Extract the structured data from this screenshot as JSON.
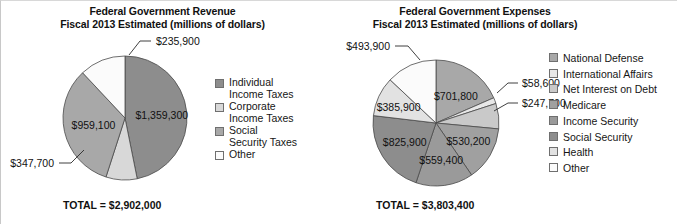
{
  "figure": {
    "width": 677,
    "height": 224,
    "background": "#ffffff"
  },
  "palette": {
    "dark_gray": "#8d8d8d",
    "mid_gray": "#a8a8a8",
    "light_gray": "#c9c9c9",
    "lighter_gray": "#d8d8d8",
    "very_light_gray": "#e8e8e8",
    "near_white": "#f2f2f2",
    "white": "#fbfbfb",
    "outline": "#4a4a4a"
  },
  "charts": [
    {
      "id": "revenue",
      "title_line1": "Federal Government Revenue",
      "title_line2": "Fiscal 2013 Estimated (millions of dollars)",
      "total_label": "TOTAL = $2,902,000",
      "legend": [
        {
          "label": "Individual\nIncome Taxes",
          "color": "#8d8d8d"
        },
        {
          "label": "Corporate\nIncome Taxes",
          "color": "#d8d8d8"
        },
        {
          "label": "Social\nSecurity Taxes",
          "color": "#a8a8a8"
        },
        {
          "label": "Other",
          "color": "#fbfbfb"
        }
      ]
    },
    {
      "id": "expenses",
      "title_line1": "Federal Government Expenses",
      "title_line2": "Fiscal 2013 Estimated (millions of dollars)",
      "total_label": "TOTAL = $3,803,400",
      "legend": [
        {
          "label": "National Defense",
          "color": "#a8a8a8"
        },
        {
          "label": "International Affairs",
          "color": "#e8e8e8"
        },
        {
          "label": "Net Interest on Debt",
          "color": "#c9c9c9"
        },
        {
          "label": "Medicare",
          "color": "#a0a0a0"
        },
        {
          "label": "Income Security",
          "color": "#9a9a9a"
        },
        {
          "label": "Social Security",
          "color": "#8d8d8d"
        },
        {
          "label": "Health",
          "color": "#e2e2e2"
        },
        {
          "label": "Other",
          "color": "#fbfbfb"
        }
      ]
    }
  ],
  "chart_data": [
    {
      "type": "pie",
      "title": "Federal Government Revenue — Fiscal 2013 Estimated (millions of dollars)",
      "total": 2902000,
      "total_label": "TOTAL = $2,902,000",
      "units": "millions of dollars",
      "start_angle_deg": 0,
      "direction": "clockwise",
      "legend_position": "right",
      "labels": [
        "Individual Income Taxes",
        "Corporate Income Taxes",
        "Social Security Taxes",
        "Other"
      ],
      "values": [
        1359300,
        235900,
        959100,
        347700
      ],
      "value_labels": [
        "$1,359,300",
        "$235,900",
        "$959,100",
        "$347,700"
      ],
      "colors": [
        "#8d8d8d",
        "#d8d8d8",
        "#a8a8a8",
        "#fbfbfb"
      ],
      "slices": [
        {
          "label": "Individual Income Taxes",
          "value": 1359300,
          "value_label": "$1,359,300",
          "color": "#8d8d8d",
          "label_placement": "inside"
        },
        {
          "label": "Corporate Income Taxes",
          "value": 235900,
          "value_label": "$235,900",
          "color": "#d8d8d8",
          "label_placement": "callout"
        },
        {
          "label": "Social Security Taxes",
          "value": 959100,
          "value_label": "$959,100",
          "color": "#a8a8a8",
          "label_placement": "inside"
        },
        {
          "label": "Other",
          "value": 347700,
          "value_label": "$347,700",
          "color": "#fbfbfb",
          "label_placement": "callout"
        }
      ]
    },
    {
      "type": "pie",
      "title": "Federal Government Expenses — Fiscal 2013 Estimated (millions of dollars)",
      "total": 3803400,
      "total_label": "TOTAL = $3,803,400",
      "units": "millions of dollars",
      "start_angle_deg": 0,
      "direction": "clockwise",
      "legend_position": "right",
      "labels": [
        "National Defense",
        "International Affairs",
        "Net Interest on Debt",
        "Medicare",
        "Income Security",
        "Social Security",
        "Health",
        "Other"
      ],
      "values": [
        701800,
        58600,
        247700,
        530200,
        559400,
        825900,
        385900,
        493900
      ],
      "value_labels": [
        "$701,800",
        "$58,600",
        "$247,700",
        "$530,200",
        "$559,400",
        "$825,900",
        "$385,900",
        "$493,900"
      ],
      "colors": [
        "#a8a8a8",
        "#e8e8e8",
        "#c9c9c9",
        "#a0a0a0",
        "#9a9a9a",
        "#8d8d8d",
        "#e2e2e2",
        "#fbfbfb"
      ],
      "slices": [
        {
          "label": "National Defense",
          "value": 701800,
          "value_label": "$701,800",
          "color": "#a8a8a8",
          "label_placement": "inside"
        },
        {
          "label": "International Affairs",
          "value": 58600,
          "value_label": "$58,600",
          "color": "#e8e8e8",
          "label_placement": "callout"
        },
        {
          "label": "Net Interest on Debt",
          "value": 247700,
          "value_label": "$247,700",
          "color": "#c9c9c9",
          "label_placement": "callout"
        },
        {
          "label": "Medicare",
          "value": 530200,
          "value_label": "$530,200",
          "color": "#a0a0a0",
          "label_placement": "inside"
        },
        {
          "label": "Income Security",
          "value": 559400,
          "value_label": "$559,400",
          "color": "#9a9a9a",
          "label_placement": "inside"
        },
        {
          "label": "Social Security",
          "value": 825900,
          "value_label": "$825,900",
          "color": "#8d8d8d",
          "label_placement": "inside"
        },
        {
          "label": "Health",
          "value": 385900,
          "value_label": "$385,900",
          "color": "#e2e2e2",
          "label_placement": "inside"
        },
        {
          "label": "Other",
          "value": 493900,
          "value_label": "$493,900",
          "color": "#fbfbfb",
          "label_placement": "callout"
        }
      ]
    }
  ],
  "geometry": {
    "revenue": {
      "cx": 124,
      "cy": 87,
      "r": 62
    },
    "expenses": {
      "cx": 98,
      "cy": 92,
      "r": 63
    }
  }
}
